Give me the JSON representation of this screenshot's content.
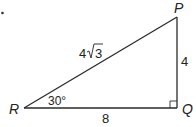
{
  "diagram": {
    "type": "right-triangle",
    "marker": "•",
    "vertices": {
      "P": {
        "label": "P"
      },
      "Q": {
        "label": "Q"
      },
      "R": {
        "label": "R"
      }
    },
    "sides": {
      "RP": {
        "coefficient": "4",
        "radicand": "3"
      },
      "PQ": {
        "label": "4"
      },
      "RQ": {
        "label": "8"
      }
    },
    "angles": {
      "R": {
        "label": "30°"
      },
      "Q": {
        "right_angle": true
      }
    },
    "colors": {
      "line": "#2a2a2a",
      "text": "#222222",
      "background": "#ffffff"
    }
  }
}
